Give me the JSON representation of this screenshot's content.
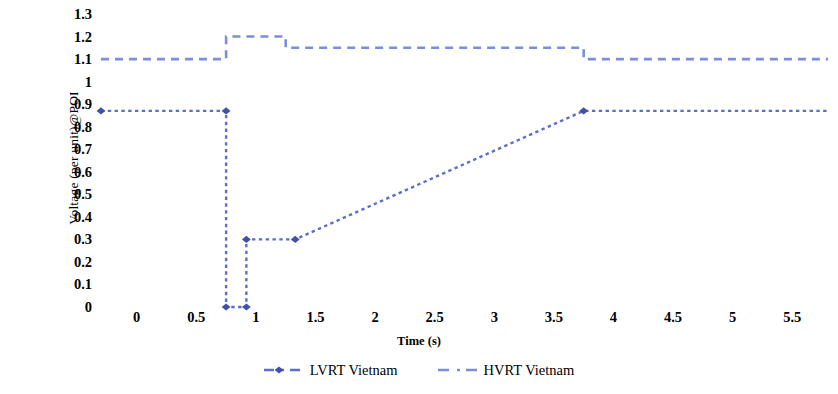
{
  "chart_data": {
    "type": "line",
    "title": "",
    "xlabel": "Time (s)",
    "ylabel": "Voltage (per unit)@POI",
    "xlim": [
      -0.35,
      5.8
    ],
    "ylim": [
      0,
      1.3
    ],
    "grid": false,
    "legend_position": "bottom-center",
    "xticks": [
      "0",
      "0.5",
      "1",
      "1.5",
      "2",
      "2.5",
      "3",
      "3.5",
      "4",
      "4.5",
      "5",
      "5.5"
    ],
    "xtick_values": [
      0,
      0.5,
      1,
      1.5,
      2,
      2.5,
      3,
      3.5,
      4,
      4.5,
      5,
      5.5
    ],
    "yticks": [
      "0",
      "0.1",
      "0.2",
      "0.3",
      "0.4",
      "0.5",
      "0.6",
      "0.7",
      "0.8",
      "0.9",
      "1",
      "1.1",
      "1.2",
      "1.3"
    ],
    "ytick_values": [
      0,
      0.1,
      0.2,
      0.3,
      0.4,
      0.5,
      0.6,
      0.7,
      0.8,
      0.9,
      1.0,
      1.1,
      1.2,
      1.3
    ],
    "series": [
      {
        "name": "LVRT Vietnam",
        "color": "#5b6ec9",
        "marker": "diamond",
        "marker_color": "#3f51a8",
        "linestyle": "dotted-dashed",
        "x": [
          -0.3,
          0.75,
          0.75,
          0.92,
          0.92,
          1.33,
          3.75,
          5.8
        ],
        "y": [
          0.87,
          0.87,
          0.0,
          0.0,
          0.3,
          0.3,
          0.87,
          0.87
        ],
        "marker_points": [
          {
            "x": -0.3,
            "y": 0.87
          },
          {
            "x": 0.75,
            "y": 0.87
          },
          {
            "x": 0.75,
            "y": 0.0
          },
          {
            "x": 0.92,
            "y": 0.0
          },
          {
            "x": 0.92,
            "y": 0.3
          },
          {
            "x": 1.33,
            "y": 0.3
          },
          {
            "x": 3.75,
            "y": 0.87
          }
        ]
      },
      {
        "name": "HVRT Vietnam",
        "color": "#7b8ed8",
        "marker": "none",
        "marker_color": "#7b8ed8",
        "linestyle": "dashed",
        "x": [
          -0.3,
          0.75,
          0.75,
          1.25,
          1.25,
          3.75,
          3.75,
          5.8
        ],
        "y": [
          1.1,
          1.1,
          1.2,
          1.2,
          1.15,
          1.15,
          1.1,
          1.1
        ]
      }
    ]
  },
  "legend": {
    "entries": [
      {
        "label": "LVRT Vietnam",
        "color": "#5b6ec9",
        "marker": "diamond"
      },
      {
        "label": "HVRT Vietnam",
        "color": "#7b8ed8",
        "marker": "none"
      }
    ]
  },
  "colors": {
    "lvrt_line": "#5b6ec9",
    "lvrt_marker": "#3f51a8",
    "hvrt_line": "#7b8ed8",
    "background": "#ffffff",
    "text": "#000000"
  }
}
